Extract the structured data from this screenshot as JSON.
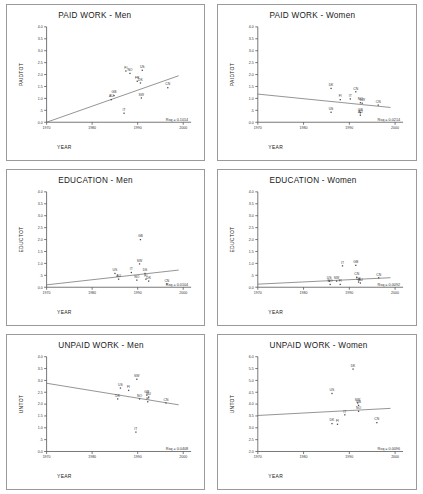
{
  "figure": {
    "layout": "2 columns x 3 rows of scatterplots",
    "columns": [
      "Men",
      "Women"
    ],
    "rows": [
      "PAID WORK",
      "EDUCATION",
      "UNPAID WORK"
    ]
  },
  "chart_data": [
    {
      "type": "scatter",
      "title": "PAID WORK - Men",
      "xlabel": "YEAR",
      "ylabel": "PAIDTOT",
      "xlim": [
        1970,
        2000
      ],
      "xticks": [
        1970,
        1980,
        1990,
        2000
      ],
      "ylim": [
        0.0,
        4.0
      ],
      "yticks": [
        "0.0",
        ".5",
        "1.0",
        "1.5",
        "2.0",
        "2.5",
        "3.0",
        "3.5",
        "4.0"
      ],
      "grid": false,
      "annotation": "Rsq = 0.1014",
      "trend": {
        "x0": 1970,
        "y0": 0.0,
        "x1": 1999,
        "y1": 1.95
      },
      "points": [
        {
          "label": "FI",
          "x": 1987.4,
          "y": 2.15
        },
        {
          "label": "US",
          "x": 1991.0,
          "y": 2.18
        },
        {
          "label": "NO",
          "x": 1988.3,
          "y": 2.05
        },
        {
          "label": "FR",
          "x": 1989.9,
          "y": 1.72
        },
        {
          "label": "DK",
          "x": 1990.6,
          "y": 1.65
        },
        {
          "label": "CN",
          "x": 1996.6,
          "y": 1.45
        },
        {
          "label": "GB",
          "x": 1984.8,
          "y": 1.12
        },
        {
          "label": "AU",
          "x": 1984.2,
          "y": 0.95
        },
        {
          "label": "SW",
          "x": 1990.8,
          "y": 1.02
        },
        {
          "label": "IT",
          "x": 1987.0,
          "y": 0.38
        }
      ]
    },
    {
      "type": "scatter",
      "title": "PAID WORK - Women",
      "xlabel": "YEAR",
      "ylabel": "PAIDTOT",
      "xlim": [
        1970,
        2000
      ],
      "xticks": [
        1970,
        1980,
        1990,
        2000
      ],
      "ylim": [
        0.0,
        4.0
      ],
      "yticks": [
        "0.0",
        ".5",
        "1.0",
        "1.5",
        "2.0",
        "2.5",
        "3.0",
        "3.5",
        "4.0"
      ],
      "grid": false,
      "annotation": "Rsq = 0.0214",
      "trend": {
        "x0": 1970,
        "y0": 1.18,
        "x1": 1999,
        "y1": 0.62
      },
      "points": [
        {
          "label": "DK",
          "x": 1986.0,
          "y": 1.42
        },
        {
          "label": "CN",
          "x": 1991.4,
          "y": 1.28
        },
        {
          "label": "FI",
          "x": 1988.0,
          "y": 0.95
        },
        {
          "label": "IT",
          "x": 1990.2,
          "y": 0.98
        },
        {
          "label": "NO",
          "x": 1992.4,
          "y": 0.82
        },
        {
          "label": "SW",
          "x": 1992.8,
          "y": 0.8
        },
        {
          "label": "CN",
          "x": 1996.3,
          "y": 0.72
        },
        {
          "label": "US",
          "x": 1986.0,
          "y": 0.42
        },
        {
          "label": "GB",
          "x": 1992.4,
          "y": 0.4
        },
        {
          "label": "AU",
          "x": 1992.4,
          "y": 0.3
        }
      ]
    },
    {
      "type": "scatter",
      "title": "EDUCATION - Men",
      "xlabel": "YEAR",
      "ylabel": "EDUCTOT",
      "xlim": [
        1970,
        2000
      ],
      "xticks": [
        1970,
        1980,
        1990,
        2000
      ],
      "ylim": [
        0.0,
        4.0
      ],
      "yticks": [
        "0.0",
        ".5",
        "1.0",
        "1.5",
        "2.0",
        "2.5",
        "3.0",
        "3.5",
        "4.0"
      ],
      "grid": false,
      "annotation": "Rsq = 0.0104",
      "trend": {
        "x0": 1970,
        "y0": 0.1,
        "x1": 1999,
        "y1": 0.72
      },
      "points": [
        {
          "label": "GB",
          "x": 1990.6,
          "y": 2.0
        },
        {
          "label": "SW",
          "x": 1990.4,
          "y": 0.98
        },
        {
          "label": "US",
          "x": 1985.0,
          "y": 0.58
        },
        {
          "label": "IT",
          "x": 1988.6,
          "y": 0.62
        },
        {
          "label": "DS",
          "x": 1991.6,
          "y": 0.58
        },
        {
          "label": "AU",
          "x": 1985.8,
          "y": 0.34
        },
        {
          "label": "NO",
          "x": 1989.8,
          "y": 0.3
        },
        {
          "label": "FI",
          "x": 1991.8,
          "y": 0.34
        },
        {
          "label": "DK",
          "x": 1992.4,
          "y": 0.26
        },
        {
          "label": "CN",
          "x": 1996.4,
          "y": 0.14
        }
      ]
    },
    {
      "type": "scatter",
      "title": "EDUCATION - Women",
      "xlabel": "YEAR",
      "ylabel": "EDUCTOT",
      "xlim": [
        1970,
        2000
      ],
      "xticks": [
        1970,
        1980,
        1990,
        2000
      ],
      "ylim": [
        0.0,
        4.0
      ],
      "yticks": [
        "0.0",
        ".5",
        "1.0",
        "1.5",
        "2.0",
        "2.5",
        "3.0",
        "3.5",
        "4.0"
      ],
      "grid": false,
      "annotation": "Rsq = 0.0092",
      "trend": {
        "x0": 1970,
        "y0": 0.13,
        "x1": 1999,
        "y1": 0.4
      },
      "points": [
        {
          "label": "IT",
          "x": 1988.5,
          "y": 0.9
        },
        {
          "label": "GB",
          "x": 1991.4,
          "y": 0.92
        },
        {
          "label": "CN",
          "x": 1991.6,
          "y": 0.42
        },
        {
          "label": "CN",
          "x": 1996.4,
          "y": 0.4
        },
        {
          "label": "US",
          "x": 1985.6,
          "y": 0.26
        },
        {
          "label": "SW",
          "x": 1987.2,
          "y": 0.26
        },
        {
          "label": "NO",
          "x": 1985.8,
          "y": 0.12
        },
        {
          "label": "FI",
          "x": 1988.0,
          "y": 0.12
        },
        {
          "label": "DK",
          "x": 1992.0,
          "y": 0.22
        },
        {
          "label": "AU",
          "x": 1992.4,
          "y": 0.18
        }
      ]
    },
    {
      "type": "scatter",
      "title": "UNPAID WORK - Men",
      "xlabel": "YEAR",
      "ylabel": "UNTOT",
      "xlim": [
        1970,
        2000
      ],
      "xticks": [
        1970,
        1980,
        1990,
        2000
      ],
      "ylim": [
        0.0,
        4.0
      ],
      "yticks": [
        "0.0",
        ".5",
        "1.0",
        "1.5",
        "2.0",
        "2.5",
        "3.0",
        "3.5",
        "4.0"
      ],
      "grid": false,
      "annotation": "Rsq = 0.0408",
      "trend": {
        "x0": 1970,
        "y0": 2.88,
        "x1": 1999,
        "y1": 1.97
      },
      "points": [
        {
          "label": "SW",
          "x": 1989.8,
          "y": 3.05
        },
        {
          "label": "US",
          "x": 1986.2,
          "y": 2.68
        },
        {
          "label": "FI",
          "x": 1988.0,
          "y": 2.58
        },
        {
          "label": "GB",
          "x": 1992.0,
          "y": 2.38
        },
        {
          "label": "NU",
          "x": 1992.4,
          "y": 2.3
        },
        {
          "label": "NO",
          "x": 1990.4,
          "y": 2.22
        },
        {
          "label": "DK",
          "x": 1985.6,
          "y": 2.22
        },
        {
          "label": "FI",
          "x": 1992.2,
          "y": 2.1
        },
        {
          "label": "CN",
          "x": 1996.2,
          "y": 2.05
        },
        {
          "label": "IT",
          "x": 1989.6,
          "y": 0.82
        }
      ]
    },
    {
      "type": "scatter",
      "title": "UNPAID WORK - Women",
      "xlabel": "YEAR",
      "ylabel": "UNTOT",
      "xlim": [
        2.0,
        6.0
      ],
      "xticks": [
        1970,
        1980,
        1990,
        2000
      ],
      "ylim": [
        2.0,
        6.0
      ],
      "yticks": [
        "2.0",
        "2.5",
        "3.0",
        "3.5",
        "4.0",
        "4.5",
        "5.0",
        "5.5",
        "6.0"
      ],
      "grid": false,
      "annotation": "Rsq = 0.0096",
      "trend": {
        "x0": 1970,
        "y0": 3.52,
        "x1": 1999,
        "y1": 3.82
      },
      "points": [
        {
          "label": "DK",
          "x": 1990.8,
          "y": 5.48
        },
        {
          "label": "US",
          "x": 1986.2,
          "y": 4.45
        },
        {
          "label": "SW",
          "x": 1991.8,
          "y": 4.05
        },
        {
          "label": "GB",
          "x": 1992.0,
          "y": 3.95
        },
        {
          "label": "NO",
          "x": 1992.0,
          "y": 3.7
        },
        {
          "label": "IT",
          "x": 1989.0,
          "y": 3.55
        },
        {
          "label": "DK",
          "x": 1986.2,
          "y": 3.18
        },
        {
          "label": "FI",
          "x": 1987.4,
          "y": 3.15
        },
        {
          "label": "CN",
          "x": 1996.0,
          "y": 3.22
        }
      ]
    }
  ]
}
